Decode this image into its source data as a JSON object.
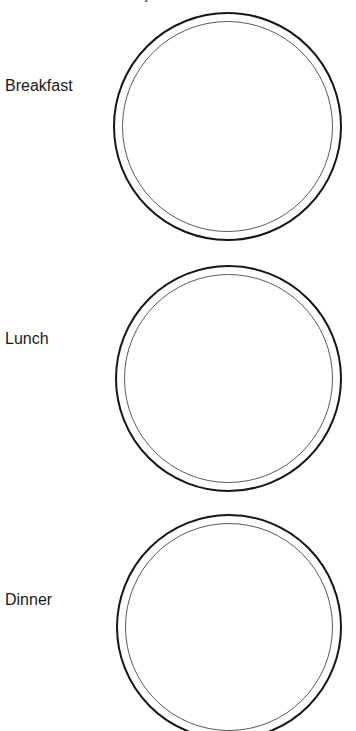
{
  "page": {
    "title": "My Meal Plate",
    "background_color": "#ffffff"
  },
  "plate_style": {
    "outer_ring_color": "#161616",
    "inner_ring_color": "#5a5a5a",
    "fill_color": "#ffffff"
  },
  "meals": [
    {
      "label": "Breakfast",
      "plate_name": "breakfast-plate"
    },
    {
      "label": "Lunch",
      "plate_name": "lunch-plate"
    },
    {
      "label": "Dinner",
      "plate_name": "dinner-plate"
    }
  ]
}
